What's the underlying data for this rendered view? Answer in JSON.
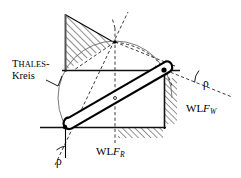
{
  "figure": {
    "background_color": "#ffffff",
    "stroke_color": "#000000",
    "width": 241,
    "height": 178
  },
  "labels": {
    "thales_first_letter": "T",
    "thales_rest": "HALES",
    "thales_hyphen": "-",
    "kreis": "Kreis",
    "wl_fw_prefix": "WL",
    "wl_fw_symbol": "F",
    "wl_fw_subscript": "W",
    "wl_fr_prefix": "WL",
    "wl_fr_symbol": "F",
    "wl_fr_subscript": "R",
    "rho_right": "ρ",
    "rho_left": "ρ"
  },
  "geometry": {
    "pivot_right": {
      "x": 164,
      "y": 70
    },
    "pivot_left": {
      "x": 65,
      "y": 127
    },
    "rod_midpoint": {
      "x": 115,
      "y": 98
    },
    "apex": {
      "x": 115,
      "y": 42
    },
    "horizontal_line": {
      "x1": 62,
      "y1": 70,
      "x2": 180,
      "y2": 70
    },
    "bottom_line": {
      "x1": 40,
      "y1": 127,
      "x2": 166,
      "y2": 127
    },
    "vertical_wall_left": {
      "x": 65,
      "y1": 14,
      "y2": 72
    },
    "vertical_wall_right": {
      "x": 164,
      "y1": 63,
      "y2": 129
    },
    "thales_circle": {
      "cx": 115,
      "cy": 98,
      "r": 57
    },
    "rod_half_width": 5.5
  },
  "angles": {
    "rho_right_degrees": 22,
    "rho_left_degrees": 22
  },
  "hatching": {
    "upper_left_region": "triangle between left wall, horizontal line and apex",
    "right_wall_region": "strip right of right wall",
    "bottom_region": "strip below bottom line"
  },
  "colors": {
    "line": "#000000",
    "hatch": "#3a3a3a",
    "thin_gray": "#555555"
  }
}
